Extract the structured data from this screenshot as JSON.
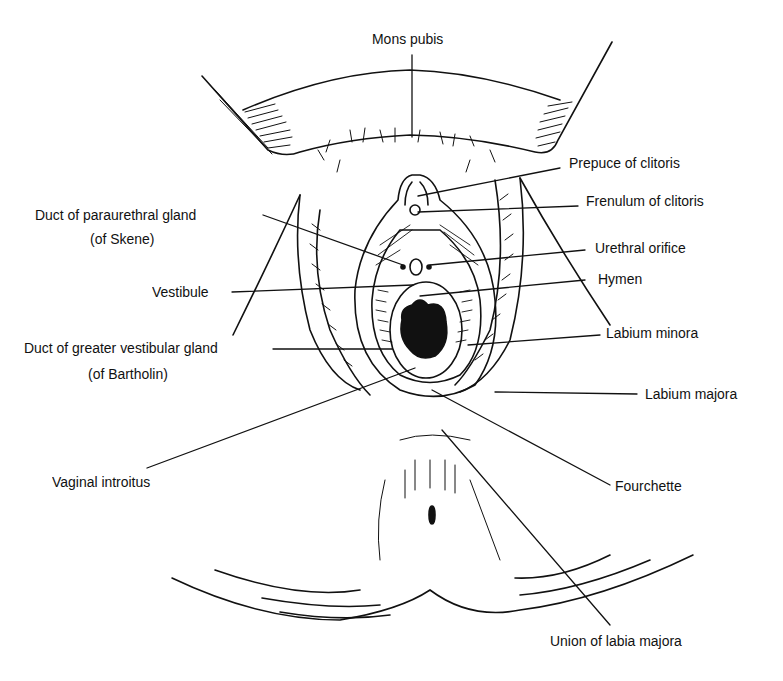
{
  "diagram": {
    "labels": {
      "mons_pubis": "Mons pubis",
      "prepuce": "Prepuce of clitoris",
      "frenulum": "Frenulum of clitoris",
      "paraurethral_1": "Duct of paraurethral gland",
      "paraurethral_2": "(of Skene)",
      "urethral": "Urethral orifice",
      "vestibule": "Vestibule",
      "hymen": "Hymen",
      "bartholin_1": "Duct of greater vestibular gland",
      "bartholin_2": "(of Bartholin)",
      "labium_minora": "Labium minora",
      "labium_majora": "Labium majora",
      "vaginal_introitus": "Vaginal introitus",
      "fourchette": "Fourchette",
      "union": "Union of labia majora"
    },
    "colors": {
      "line": "#111111",
      "background": "#ffffff"
    }
  }
}
